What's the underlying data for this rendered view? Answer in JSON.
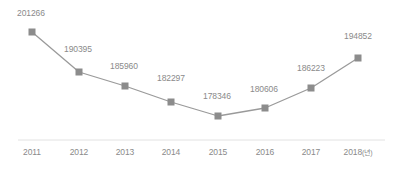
{
  "chart_data": {
    "type": "line",
    "title": "",
    "xlabel": "",
    "ylabel": "",
    "grid": false,
    "legend": "none",
    "axis_unit_note": "(년)",
    "categories": [
      "2011",
      "2012",
      "2013",
      "2014",
      "2015",
      "2016",
      "2017",
      "2018"
    ],
    "tick_labels": [
      "2011",
      "2012",
      "2013",
      "2014",
      "2015",
      "2016",
      "2017",
      "2018(년)"
    ],
    "values": [
      201266,
      190395,
      185960,
      182297,
      178346,
      180606,
      186223,
      194852
    ],
    "value_labels": [
      "201266",
      "190395",
      "185960",
      "182297",
      "178346",
      "180606",
      "186223",
      "194852"
    ],
    "ylim": [
      172000,
      205000
    ],
    "series": [
      {
        "name": "",
        "values": [
          201266,
          190395,
          185960,
          182297,
          178346,
          180606,
          186223,
          194852
        ]
      }
    ],
    "colors": {
      "line": "#9a9a9a",
      "marker": "#8c8c8c",
      "label_text": "#8a8a8a",
      "axis_line": "#e2e2e2",
      "background": "#ffffff"
    },
    "points": [
      {
        "x": 32,
        "y": 32,
        "label": "201266",
        "label_x": 17,
        "label_y": 9,
        "tick_x": 32
      },
      {
        "x": 79,
        "y": 72,
        "label": "190395",
        "label_x": 64,
        "label_y": 45,
        "tick_x": 79
      },
      {
        "x": 125,
        "y": 86,
        "label": "185960",
        "label_x": 110,
        "label_y": 62,
        "tick_x": 125
      },
      {
        "x": 171,
        "y": 102,
        "label": "182297",
        "label_x": 157,
        "label_y": 74,
        "tick_x": 171
      },
      {
        "x": 218,
        "y": 116,
        "label": "178346",
        "label_x": 203,
        "label_y": 92,
        "tick_x": 218
      },
      {
        "x": 265,
        "y": 108,
        "label": "180606",
        "label_x": 250,
        "label_y": 85,
        "tick_x": 265
      },
      {
        "x": 311,
        "y": 88,
        "label": "186223",
        "label_x": 297,
        "label_y": 64,
        "tick_x": 311
      },
      {
        "x": 358,
        "y": 58,
        "label": "194852",
        "label_x": 344,
        "label_y": 32,
        "tick_x": 358
      }
    ],
    "axis": {
      "x_start": 18,
      "x_end": 385,
      "y": 140,
      "tick_label_y": 148
    }
  }
}
